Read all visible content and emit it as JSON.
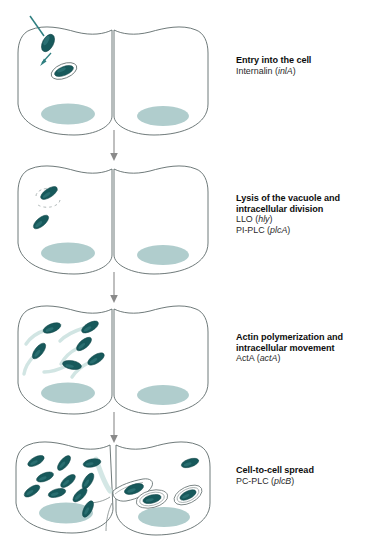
{
  "figure": {
    "colors": {
      "bacterium": "#17595b",
      "bacterium_highlight": "#3c8486",
      "nucleus": "#a9c9c9",
      "membrane_outline": "#5f6b6b",
      "actin_tail": "#cfe4e2",
      "arrow": "#8a8a8a",
      "entry_arrow": "#2f7f80",
      "background": "#ffffff"
    }
  },
  "stages": [
    {
      "id": "entry",
      "title": "Entry into the cell",
      "lines": [
        {
          "protein": "Internalin",
          "gene": "inlA"
        }
      ],
      "bacteria_count": 2,
      "vacuole_count": 1
    },
    {
      "id": "lysis",
      "title_line1": "Lysis of the vacuole and",
      "title_line2": "intracellular division",
      "lines": [
        {
          "protein": "LLO",
          "gene": "hly"
        },
        {
          "protein": "PI-PLC",
          "gene": "plcA"
        }
      ],
      "bacteria_count": 2,
      "vacuole_count": 1
    },
    {
      "id": "actin",
      "title_line1": "Actin polymerization and",
      "title_line2": "intracellular movement",
      "lines": [
        {
          "protein": "ActA",
          "gene": "actA"
        }
      ],
      "bacteria_count": 6,
      "vacuole_count": 0
    },
    {
      "id": "spread",
      "title": "Cell-to-cell spread",
      "lines": [
        {
          "protein": "PC-PLC",
          "gene": "plcB"
        }
      ],
      "bacteria_count": 14,
      "vacuole_count": 3
    }
  ]
}
